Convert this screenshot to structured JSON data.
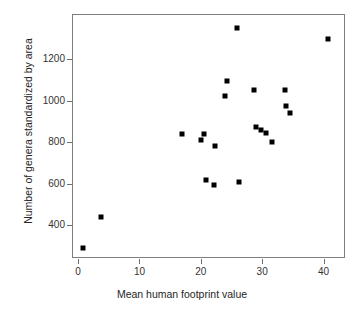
{
  "chart_data": {
    "type": "scatter",
    "title": "",
    "xlabel": "Mean human footprint value",
    "ylabel": "Number of genera standardized by area",
    "xlim": [
      -1.0,
      43.5
    ],
    "ylim": [
      240,
      1420
    ],
    "xticks": [
      0,
      10,
      20,
      30,
      40
    ],
    "xticklabels": [
      "0",
      "10",
      "20",
      "30",
      "40"
    ],
    "yticks": [
      400,
      600,
      800,
      1000,
      1200
    ],
    "yticklabels": [
      "400",
      "600",
      "800",
      "1000",
      "1200"
    ],
    "grid": false,
    "legend": null,
    "marker": "square",
    "marker_color": "#000000",
    "marker_size_px": 5,
    "points": [
      {
        "x": 0.6,
        "y": 291
      },
      {
        "x": 3.5,
        "y": 441
      },
      {
        "x": 16.7,
        "y": 845
      },
      {
        "x": 19.9,
        "y": 814
      },
      {
        "x": 20.3,
        "y": 845
      },
      {
        "x": 20.6,
        "y": 623
      },
      {
        "x": 22.0,
        "y": 600
      },
      {
        "x": 22.2,
        "y": 786
      },
      {
        "x": 23.8,
        "y": 1027
      },
      {
        "x": 24.1,
        "y": 1100
      },
      {
        "x": 25.8,
        "y": 1355
      },
      {
        "x": 26.1,
        "y": 614
      },
      {
        "x": 28.5,
        "y": 1059
      },
      {
        "x": 28.9,
        "y": 877
      },
      {
        "x": 29.6,
        "y": 863
      },
      {
        "x": 30.5,
        "y": 850
      },
      {
        "x": 31.4,
        "y": 805
      },
      {
        "x": 33.5,
        "y": 1059
      },
      {
        "x": 33.7,
        "y": 982
      },
      {
        "x": 34.4,
        "y": 945
      },
      {
        "x": 40.6,
        "y": 1305
      }
    ]
  },
  "axes": {
    "x_title": "Mean human footprint value",
    "y_title": "Number of genera standardized by area",
    "x_tick_labels": [
      "0",
      "10",
      "20",
      "30",
      "40"
    ],
    "y_tick_labels": [
      "400",
      "600",
      "800",
      "1000",
      "1200"
    ]
  },
  "colors": {
    "marker": "#000000",
    "frame": "#7d7d7d",
    "tick": "#6f6f6f",
    "text": "#262626",
    "background": "#ffffff"
  }
}
